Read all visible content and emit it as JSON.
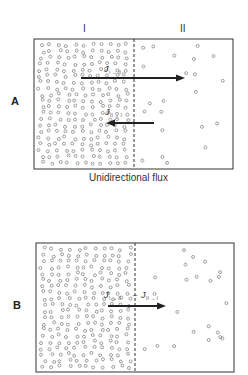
{
  "compartments": {
    "left": "I",
    "right": "II"
  },
  "panels": [
    {
      "id": "A",
      "label": "A",
      "caption": "Unidirectional flux",
      "box": {
        "x": 34,
        "y": 39,
        "w": 199,
        "h": 130
      },
      "membrane_x": 134,
      "arrows": [
        {
          "x1": 81,
          "x2": 185,
          "y": 78,
          "dir": "right",
          "label": "J",
          "sub": "I → II",
          "label_x": 104,
          "label_y": 72
        },
        {
          "x1": 154,
          "x2": 106,
          "y": 123,
          "dir": "left",
          "label": "J",
          "sub": "II → I",
          "label_x": 105,
          "label_y": 115
        }
      ]
    },
    {
      "id": "B",
      "label": "B",
      "caption": "",
      "box": {
        "x": 36,
        "y": 243,
        "w": 198,
        "h": 129
      },
      "membrane_x": 135,
      "arrows": [
        {
          "x1": 108,
          "x2": 166,
          "y": 306,
          "dir": "right",
          "label": "J",
          "sub": "I → II",
          "label_x": 104,
          "label_y": 298,
          "extra": "−",
          "label2": "J",
          "sub2": "II → I"
        }
      ]
    }
  ],
  "colors": {
    "line": "#555555",
    "arrow": "#222222",
    "particle": "#777777"
  }
}
